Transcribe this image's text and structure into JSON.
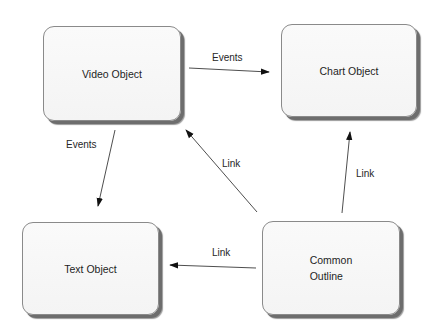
{
  "diagram": {
    "nodes": [
      {
        "id": "video",
        "label": "Video Object",
        "x": 43,
        "y": 26,
        "w": 138,
        "h": 95
      },
      {
        "id": "chart",
        "label": "Chart Object",
        "x": 281,
        "y": 24,
        "w": 136,
        "h": 93
      },
      {
        "id": "text",
        "label": "Text Object",
        "x": 22,
        "y": 222,
        "w": 137,
        "h": 93
      },
      {
        "id": "outline",
        "label": "Common\nOutline",
        "x": 262,
        "y": 221,
        "w": 138,
        "h": 94
      }
    ],
    "edges": [
      {
        "id": "video-to-chart",
        "from": "video",
        "to": "chart",
        "label": "Events",
        "x1": 189,
        "y1": 68,
        "x2": 269,
        "y2": 72,
        "lx": 212,
        "ly": 52
      },
      {
        "id": "video-to-text",
        "from": "video",
        "to": "text",
        "label": "Events",
        "x1": 115,
        "y1": 130,
        "x2": 98,
        "y2": 206,
        "lx": 66,
        "ly": 139
      },
      {
        "id": "outline-to-video",
        "from": "outline",
        "to": "video",
        "label": "Link",
        "x1": 257,
        "y1": 212,
        "x2": 186,
        "y2": 130,
        "lx": 222,
        "ly": 158
      },
      {
        "id": "outline-to-chart",
        "from": "outline",
        "to": "chart",
        "label": "Link",
        "x1": 342,
        "y1": 213,
        "x2": 350,
        "y2": 132,
        "lx": 356,
        "ly": 168
      },
      {
        "id": "outline-to-text",
        "from": "outline",
        "to": "text",
        "label": "Link",
        "x1": 256,
        "y1": 268,
        "x2": 170,
        "y2": 265,
        "lx": 212,
        "ly": 247
      }
    ],
    "colors": {
      "edge": "#3a3a3a",
      "arrowhead": "#111111",
      "node_border": "#8a8a8a",
      "node_shadow": "#6d6d6d"
    }
  }
}
